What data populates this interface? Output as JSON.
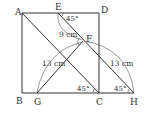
{
  "diagram": {
    "type": "geometry",
    "points": {
      "A": {
        "label": "A",
        "x": 22,
        "y": 13
      },
      "B": {
        "label": "B",
        "x": 22,
        "y": 93
      },
      "C": {
        "label": "C",
        "x": 99,
        "y": 93
      },
      "D": {
        "label": "D",
        "x": 99,
        "y": 13
      },
      "E": {
        "label": "E",
        "x": 58,
        "y": 13
      },
      "F": {
        "label": "F",
        "x": 83,
        "y": 41
      },
      "G": {
        "label": "G",
        "x": 37,
        "y": 93
      },
      "H": {
        "label": "H",
        "x": 134,
        "y": 93
      }
    },
    "segments": [
      "AB",
      "BC",
      "CD",
      "DA",
      "AC",
      "EH",
      "GF",
      "CH"
    ],
    "measurements": {
      "EF": "9 cm",
      "GF": "13 cm",
      "FH": "13 cm"
    },
    "angles": {
      "DEF": "45°",
      "ACB": "45°",
      "EHC": "45°"
    },
    "right_angle_mark": "F"
  }
}
